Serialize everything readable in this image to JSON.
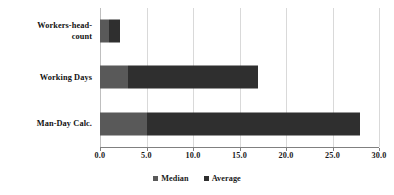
{
  "chart_data": {
    "type": "bar",
    "orientation": "horizontal",
    "stacked": true,
    "title": "",
    "subtitle": "",
    "xlabel": "",
    "ylabel": "",
    "categories": [
      "Workers-head-count",
      "Working Days",
      "Man-Day Calc."
    ],
    "category_label_lines": [
      [
        "Workers-head-",
        "count"
      ],
      [
        "Working Days"
      ],
      [
        "Man-Day Calc."
      ]
    ],
    "series": [
      {
        "name": "Median",
        "color": "#595959",
        "values": [
          1.0,
          3.0,
          5.0
        ]
      },
      {
        "name": "Average",
        "color": "#2f2f2f",
        "values": [
          1.1,
          14.0,
          23.0
        ]
      }
    ],
    "stack_totals": [
      2.1,
      17.0,
      28.0
    ],
    "xlim": [
      0.0,
      30.0
    ],
    "xticks": [
      0.0,
      5.0,
      10.0,
      15.0,
      20.0,
      25.0,
      30.0
    ],
    "xtick_labels": [
      "0.0",
      "5.0",
      "10.0",
      "15.0",
      "20.0",
      "25.0",
      "30.0"
    ],
    "grid": true,
    "grid_axis": "x",
    "grid_color": "#d9d9d9",
    "legend": {
      "position": "bottom-center",
      "marker": "square",
      "entries": [
        {
          "label": "Median",
          "color": "#595959"
        },
        {
          "label": "Average",
          "color": "#2f2f2f"
        }
      ]
    },
    "background_color": "#ffffff",
    "axis_color": "#808080",
    "text_color": "#1a1a1a"
  }
}
